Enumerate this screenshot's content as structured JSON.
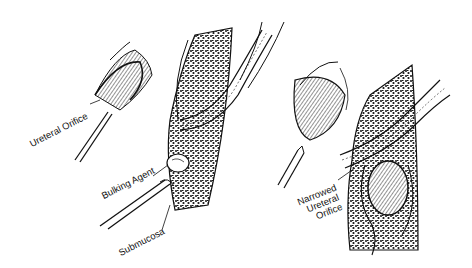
{
  "figure": {
    "colors": {
      "ink": "#111111",
      "background": "#ffffff"
    },
    "panels": [
      {
        "id": "left",
        "labels": {
          "ureteral_orifice": "Ureteral Orifice",
          "bulking_agent": "Bulking Agent",
          "submucosa": "Submucosa"
        }
      },
      {
        "id": "right",
        "labels": {
          "narrowed_line1": "Narrowed",
          "narrowed_line2": "Ureteral",
          "narrowed_line3": "Orifice"
        }
      }
    ]
  }
}
